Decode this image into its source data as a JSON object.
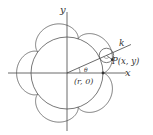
{
  "diagram": {
    "type": "epicycloid",
    "labels": {
      "x_axis": "x",
      "y_axis": "y",
      "line": "k",
      "angle": "θ",
      "point_p": "P(x, y)",
      "point_r": "(r, 0)"
    },
    "geometry": {
      "origin": [
        67,
        73
      ],
      "fixed_circle_radius": 36,
      "rolling_circle_radius": 7.2,
      "cusps": 5,
      "theta_deg": 24
    },
    "colors": {
      "stroke": "#444444",
      "text": "#333333",
      "background": "#ffffff"
    }
  }
}
